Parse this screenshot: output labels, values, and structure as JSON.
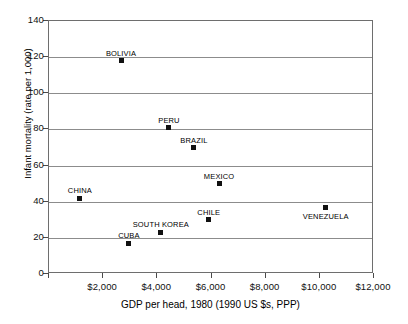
{
  "chart_data": {
    "type": "scatter",
    "title": "",
    "xlabel": "GDP per head, 1980 (1990 US $s, PPP)",
    "ylabel": "Infant mortality (rate per 1,000)",
    "xlim": [
      0,
      12000
    ],
    "ylim": [
      0,
      140
    ],
    "xticks": [
      0,
      2000,
      4000,
      6000,
      8000,
      10000,
      12000
    ],
    "xtick_labels": [
      "",
      "$2,000",
      "$4,000",
      "$6,000",
      "$8,000",
      "$10,000",
      "$12,000"
    ],
    "yticks": [
      0,
      20,
      40,
      60,
      80,
      100,
      120,
      140
    ],
    "ytick_labels": [
      "0",
      "20",
      "40",
      "60",
      "80",
      "100",
      "120",
      "140"
    ],
    "grid": true,
    "grid_axis": "y",
    "legend": "none",
    "marker_color": "#111111",
    "grid_color": "#8c8c8c",
    "frame_color": "#6e6e6e",
    "points": [
      {
        "name": "BOLIVIA",
        "x": 2660,
        "y": 118,
        "label_pos": "above"
      },
      {
        "name": "PERU",
        "x": 4430,
        "y": 81,
        "label_pos": "above"
      },
      {
        "name": "BRAZIL",
        "x": 5350,
        "y": 70,
        "label_pos": "above"
      },
      {
        "name": "MEXICO",
        "x": 6280,
        "y": 50,
        "label_pos": "above"
      },
      {
        "name": "CHINA",
        "x": 1140,
        "y": 42,
        "label_pos": "above"
      },
      {
        "name": "VENEZUELA",
        "x": 10220,
        "y": 37,
        "label_pos": "below"
      },
      {
        "name": "CHILE",
        "x": 5900,
        "y": 30,
        "label_pos": "above"
      },
      {
        "name": "SOUTH KOREA",
        "x": 4130,
        "y": 23,
        "label_pos": "above"
      },
      {
        "name": "CUBA",
        "x": 2950,
        "y": 17,
        "label_pos": "above"
      }
    ]
  }
}
